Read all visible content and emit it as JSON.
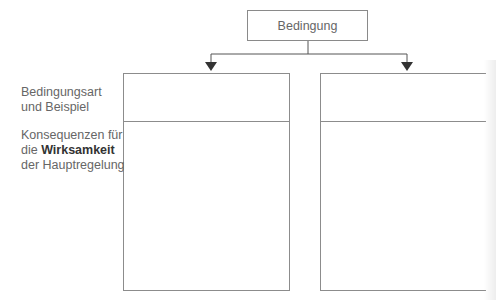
{
  "diagram": {
    "top_node": {
      "label": "Bedingung"
    },
    "row_labels": [
      {
        "lines": [
          "Bedingungsart",
          "und Beispiel"
        ]
      },
      {
        "line1": "Konsequenzen für",
        "line2_prefix": "die ",
        "line2_bold": "Wirksamkeit",
        "line3": "der Hauptregelung"
      }
    ],
    "columns": [
      {
        "header": "",
        "body": ""
      },
      {
        "header": "",
        "body": ""
      }
    ],
    "colors": {
      "line": "#8c8c8c",
      "arrow": "#333333",
      "text": "#666666",
      "bold_text": "#333333"
    }
  }
}
